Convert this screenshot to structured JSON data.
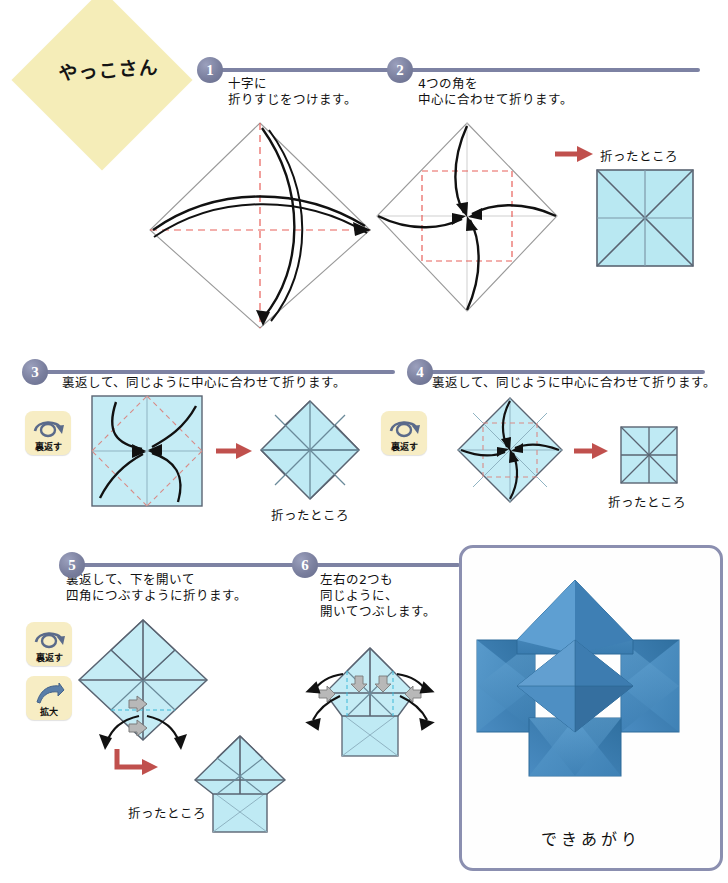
{
  "title": {
    "text": "やっこさん"
  },
  "colors": {
    "paper_fill": "#b9e8f2",
    "paper_edge": "#5a6472",
    "crease_red": "#e8605a",
    "step_circle": "#7a7f9e",
    "badge_bg": "#f7edc4",
    "title_bg": "#f5edb8",
    "photo_border": "#8b8fb0",
    "photo_blue": "#4a8fc4",
    "arrow_red": "#c0504d",
    "arrow_black": "#111111",
    "arrow_gray": "#9a9a9a"
  },
  "steps": [
    {
      "number": "1",
      "text": "十字に\n折りすじをつけます。"
    },
    {
      "number": "2",
      "text": "4つの角を\n中心に合わせて折ります。",
      "result_caption": "折ったところ"
    },
    {
      "number": "3",
      "text": "裏返して、同じように中心に合わせて折ります。",
      "badge": "裏返す",
      "result_caption": "折ったところ"
    },
    {
      "number": "4",
      "text": "裏返して、同じように中心に合わせて折ります。",
      "badge": "裏返す",
      "result_caption": "折ったところ"
    },
    {
      "number": "5",
      "text": "裏返して、下を開いて\n四角につぶすように折ります。",
      "badge": "裏返す",
      "badge2": "拡大",
      "result_caption": "折ったところ"
    },
    {
      "number": "6",
      "text": "左右の2つも\n同じように、\n開いてつぶします。"
    }
  ],
  "badges": {
    "flip": "裏返す",
    "enlarge": "拡大"
  },
  "photo": {
    "caption": "できあがり"
  }
}
